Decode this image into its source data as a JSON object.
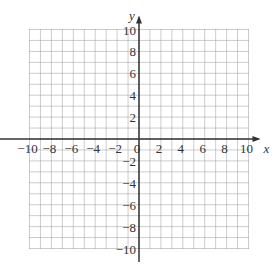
{
  "chart_data": {
    "type": "scatter",
    "title": "",
    "xlabel": "x",
    "ylabel": "y",
    "xlim": [
      -10,
      10
    ],
    "ylim": [
      -10,
      10
    ],
    "grid": true,
    "grid_step": 1,
    "x_ticks": [
      -10,
      -8,
      -6,
      -4,
      -2,
      0,
      2,
      4,
      6,
      8,
      10
    ],
    "y_ticks": [
      -10,
      -8,
      -6,
      -4,
      -2,
      2,
      4,
      6,
      8,
      10
    ],
    "x_tick_labels": [
      "−10",
      "−8",
      "−6",
      "−4",
      "−2",
      "0",
      "2",
      "4",
      "6",
      "8",
      "10"
    ],
    "y_tick_labels": [
      "−10",
      "−8",
      "−6",
      "−4",
      "−2",
      "2",
      "4",
      "6",
      "8",
      "10"
    ],
    "series": []
  },
  "colors": {
    "grid": "#999999",
    "axis": "#333333"
  }
}
